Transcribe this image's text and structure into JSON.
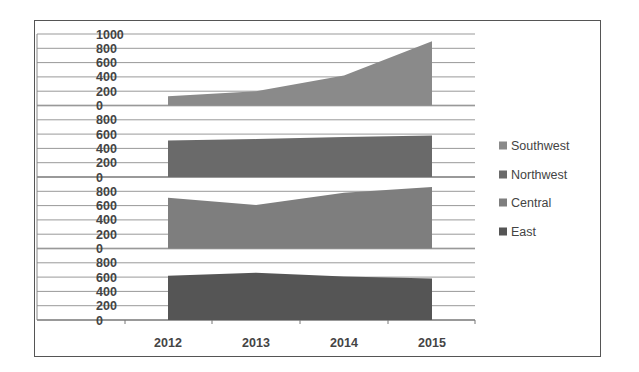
{
  "chart_data": {
    "type": "area",
    "subtype": "stacked-panel area (one panel per series)",
    "title": "",
    "xlabel": "",
    "ylabel": "",
    "categories": [
      "2012",
      "2013",
      "2014",
      "2015"
    ],
    "series": [
      {
        "name": "Southwest",
        "values": [
          130,
          200,
          420,
          900
        ],
        "color": "#8a8a8a",
        "yticks": [
          "1000",
          "800",
          "600",
          "400",
          "200",
          "0"
        ]
      },
      {
        "name": "Northwest",
        "values": [
          510,
          530,
          560,
          580
        ],
        "color": "#6a6a6a",
        "yticks": [
          "800",
          "600",
          "400",
          "200",
          "0"
        ]
      },
      {
        "name": "Central",
        "values": [
          710,
          610,
          780,
          860
        ],
        "color": "#7e7e7e",
        "yticks": [
          "800",
          "600",
          "400",
          "200",
          "0"
        ]
      },
      {
        "name": "East",
        "values": [
          620,
          660,
          610,
          580
        ],
        "color": "#555555",
        "yticks": [
          "800",
          "600",
          "400",
          "200",
          "0"
        ]
      }
    ],
    "ylim_per_panel": [
      0,
      1000
    ],
    "grid": true,
    "legend_position": "right",
    "legend_order": [
      "Southwest",
      "Northwest",
      "Central",
      "East"
    ]
  }
}
